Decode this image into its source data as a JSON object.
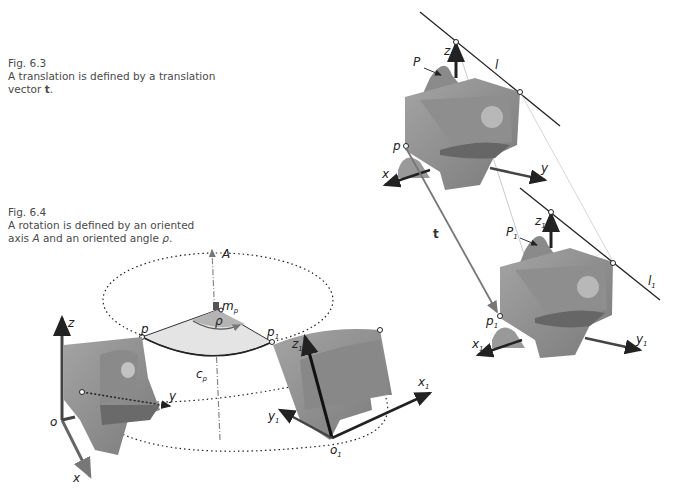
{
  "captions": [
    {
      "fig": "Fig. 6.3",
      "line1": "A translation is defined by a translation",
      "line2_pre": "vector ",
      "line2_bold": "t",
      "line2_post": "."
    },
    {
      "fig": "Fig. 6.4",
      "line1": "A rotation is defined by an oriented",
      "line2_pre": "axis ",
      "line2_italic": "A",
      "line2_mid": " and an oriented angle ",
      "line2_greek": "ρ",
      "line2_post": "."
    }
  ],
  "translation_figure": {
    "original": {
      "axes": [
        "x",
        "y",
        "z"
      ],
      "point": "p",
      "plane": "P",
      "line": "l"
    },
    "translated": {
      "axes": [
        "x1",
        "y1",
        "z1"
      ],
      "point": "p1",
      "plane": "P1",
      "line": "l1"
    },
    "vector": "t"
  },
  "rotation_figure": {
    "axis": "A",
    "angle": "ρ",
    "center": "mp",
    "arc": "cp",
    "points": [
      "p",
      "p1"
    ],
    "original_frame": {
      "origin": "o",
      "axes": [
        "x",
        "y",
        "z"
      ]
    },
    "rotated_frame": {
      "origin": "o1",
      "axes": [
        "x1",
        "y1",
        "z1"
      ]
    }
  },
  "labels": {
    "z": "z",
    "y": "y",
    "x": "x",
    "p": "p",
    "P": "P",
    "l": "l",
    "t": "t",
    "z1": "z",
    "y1": "y",
    "x1": "x",
    "p1": "p",
    "P1": "P",
    "l1": "l",
    "sub1": "1",
    "A": "A",
    "rho": "ρ",
    "m": "m",
    "mp_sub": "p",
    "c": "c",
    "cp_sub": "p",
    "o": "o",
    "o1": "o"
  },
  "colors": {
    "solid": "#8c8c8c",
    "solid_dark": "#6e6e6e",
    "solid_light": "#a9a9a9",
    "sector": "#e4e4e4",
    "line": "#222222"
  }
}
